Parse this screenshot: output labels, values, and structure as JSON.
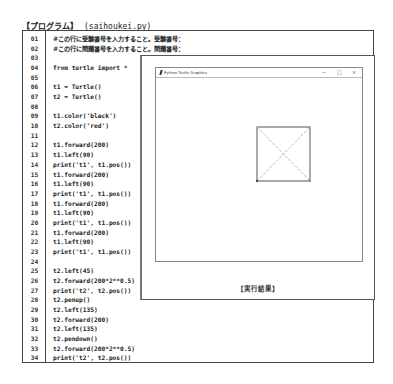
{
  "heading": {
    "title": "【プログラム】",
    "filename": "(saihoukei.py)"
  },
  "code_lines": [
    {
      "n": "01",
      "code": "#この行に受験番号を入力すること。受験番号："
    },
    {
      "n": "02",
      "code": "#この行に問題番号を入力すること。問題番号："
    },
    {
      "n": "03",
      "code": ""
    },
    {
      "n": "04",
      "code": "from turtle import *"
    },
    {
      "n": "05",
      "code": ""
    },
    {
      "n": "06",
      "code": "t1 = Turtle()"
    },
    {
      "n": "07",
      "code": "t2 = Turtle()"
    },
    {
      "n": "08",
      "code": ""
    },
    {
      "n": "09",
      "code": "t1.color('black')"
    },
    {
      "n": "10",
      "code": "t2.color('red')"
    },
    {
      "n": "11",
      "code": ""
    },
    {
      "n": "12",
      "code": "t1.forward(200)"
    },
    {
      "n": "13",
      "code": "t1.left(90)"
    },
    {
      "n": "14",
      "code": "print('t1', t1.pos())"
    },
    {
      "n": "15",
      "code": "t1.forward(200)"
    },
    {
      "n": "16",
      "code": "t1.left(90)"
    },
    {
      "n": "17",
      "code": "print('t1', t1.pos())"
    },
    {
      "n": "18",
      "code": "t1.forward(200)"
    },
    {
      "n": "19",
      "code": "t1.left(90)"
    },
    {
      "n": "20",
      "code": "print('t1', t1.pos())"
    },
    {
      "n": "21",
      "code": "t1.forward(200)"
    },
    {
      "n": "22",
      "code": "t1.left(90)"
    },
    {
      "n": "23",
      "code": "print('t1', t1.pos())"
    },
    {
      "n": "24",
      "code": ""
    },
    {
      "n": "25",
      "code": "t2.left(45)"
    },
    {
      "n": "26",
      "code": "t2.forward(200*2**0.5)"
    },
    {
      "n": "27",
      "code": "print('t2', t2.pos())"
    },
    {
      "n": "28",
      "code": "t2.penup()"
    },
    {
      "n": "29",
      "code": "t2.left(135)"
    },
    {
      "n": "30",
      "code": "t2.forward(200)"
    },
    {
      "n": "31",
      "code": "t2.left(135)"
    },
    {
      "n": "32",
      "code": "t2.pendown()"
    },
    {
      "n": "33",
      "code": "t2.forward(200*2**0.5)"
    },
    {
      "n": "34",
      "code": "print('t2', t2.pos())"
    }
  ],
  "turtle_window": {
    "title": "Python Turtle Graphics",
    "controls": {
      "minimize": "−",
      "maximize": "□",
      "close": "×"
    }
  },
  "result_caption": "【実行結果】",
  "colors": {
    "square_stroke": "#555555",
    "diagonal_stroke": "#aaaaaa"
  }
}
